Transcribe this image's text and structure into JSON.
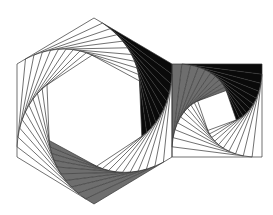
{
  "figure": {
    "background": "#ffffff",
    "stroke_color": "#333333",
    "dark_fill": "#0a0a0a",
    "gray_fill": "#6e6e6e",
    "hexagon": {
      "vertices": [
        [
          94,
          18
        ],
        [
          172,
          64
        ],
        [
          172,
          157
        ],
        [
          94,
          204
        ],
        [
          17,
          157
        ],
        [
          17,
          64
        ]
      ],
      "levels": 10,
      "fraction": 0.11
    },
    "square": {
      "vertices": [
        [
          172,
          64
        ],
        [
          262,
          64
        ],
        [
          262,
          157
        ],
        [
          172,
          157
        ]
      ],
      "levels": 10,
      "fraction": 0.11
    },
    "shaded_tracks": [
      {
        "shape": "hexagon",
        "edge": 0,
        "fill": "dark"
      },
      {
        "shape": "hexagon",
        "edge": 2,
        "fill": "gray"
      },
      {
        "shape": "square",
        "edge": 0,
        "fill": "dark"
      },
      {
        "shape": "square",
        "edge": 3,
        "fill": "gray"
      }
    ]
  }
}
